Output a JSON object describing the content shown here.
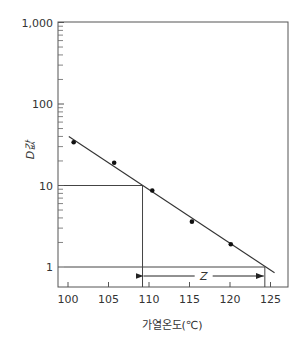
{
  "chart_data": {
    "type": "scatter",
    "title": "",
    "xlabel": "가열온도(℃)",
    "ylabel": "D값",
    "yscale": "log",
    "xlim": [
      98.5,
      128.5
    ],
    "ylim": [
      0.57,
      1000
    ],
    "x_ticks": [
      100,
      105,
      110,
      115,
      120,
      125
    ],
    "x_tick_labels": [
      "100",
      "105",
      "110",
      "115",
      "120",
      "125"
    ],
    "y_ticks": [
      1,
      10,
      100,
      1000
    ],
    "y_tick_labels": [
      "1",
      "10",
      "100",
      "1,000"
    ],
    "grid": false,
    "series": [
      {
        "name": "measured D values",
        "kind": "points",
        "x": [
          100.7,
          105.7,
          110.4,
          115.3,
          120.1
        ],
        "y": [
          34,
          19,
          8.7,
          3.6,
          1.9
        ]
      },
      {
        "name": "fitted line",
        "kind": "line",
        "x": [
          100.1,
          125.5
        ],
        "y": [
          40,
          0.85
        ]
      }
    ],
    "annotations": {
      "reference_lines": [
        {
          "type": "horizontal",
          "y": 10,
          "x_from": 100,
          "x_to": 109.2
        },
        {
          "type": "vertical",
          "x": 109.2,
          "y_from": 10,
          "y_to": 0.57
        },
        {
          "type": "horizontal",
          "y": 1,
          "x_from": 100,
          "x_to": 124.3
        },
        {
          "type": "vertical",
          "x": 124.3,
          "y_from": 1,
          "y_to": 0.57
        }
      ],
      "z_arrow": {
        "label": "Z",
        "x_from": 109.2,
        "x_to": 124.3,
        "y": 0.74
      }
    }
  }
}
